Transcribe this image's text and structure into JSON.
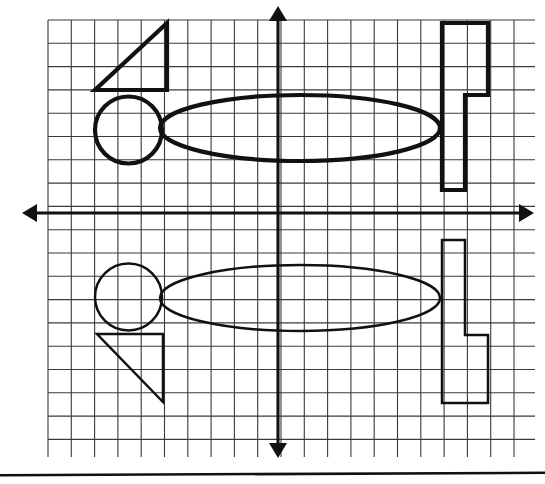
{
  "page": {
    "background_color": "#fdfdfb",
    "ink_color": "#111111",
    "grid_color": "#3a3a3a",
    "width": 545,
    "height": 484
  },
  "grid": {
    "label": "Graph paper grid",
    "cell_size": 23.3,
    "origin_x": 278,
    "origin_y": 213,
    "x_first": 48,
    "x_last": 535,
    "y_first": 20,
    "y_last": 457,
    "columns": 21,
    "rows": 19
  },
  "axes": {
    "x_axis": {
      "name": "horizontal axis",
      "y": 213,
      "x_start": 22,
      "x_end": 534,
      "arrows": "both"
    },
    "y_axis": {
      "name": "vertical axis",
      "x": 278,
      "y_start": 6,
      "y_end": 458,
      "arrows": "both"
    }
  },
  "page_rule": {
    "name": "bottom page rule",
    "y": 474,
    "x_start": 0,
    "x_end": 545
  },
  "shapes": {
    "above_axis": [
      {
        "id": "triangle-top",
        "type": "polygon",
        "weight": "heavy",
        "points": "95,90 167,90 167,23",
        "description": "right triangle, right angle at lower-right, hypotenuse rising left to right"
      },
      {
        "id": "circle-top",
        "type": "circle",
        "weight": "heavy",
        "cx": 128.5,
        "cy": 130,
        "r": 33.5,
        "description": "circle tangent to triangle base"
      },
      {
        "id": "ellipse-top",
        "type": "ellipse",
        "weight": "heavy",
        "cx": 300,
        "cy": 128,
        "rx": 140,
        "ry": 33,
        "description": "wide horizontal ellipse crossing the vertical axis"
      },
      {
        "id": "flag-top",
        "type": "polygon",
        "weight": "heavy",
        "points": "442,23 488,23 488,95 465,95 465,190 442,190",
        "description": "F-shaped block polygon at right, wide part at top"
      }
    ],
    "below_axis": [
      {
        "id": "triangle-bottom",
        "type": "polygon",
        "weight": "light",
        "points": "97,334 163,334 163,402",
        "description": "right triangle, right angle at upper-right, hypotenuse falling left to right"
      },
      {
        "id": "circle-bottom",
        "type": "circle",
        "weight": "light",
        "cx": 128.5,
        "cy": 297,
        "r": 33.5,
        "description": "circle tangent to triangle top edge"
      },
      {
        "id": "ellipse-bottom",
        "type": "ellipse",
        "weight": "light",
        "cx": 300,
        "cy": 298,
        "rx": 140,
        "ry": 33,
        "description": "wide horizontal ellipse crossing the vertical axis"
      },
      {
        "id": "flag-bottom",
        "type": "polygon",
        "weight": "light",
        "points": "442,240 465,240 465,335 488,335 488,403 442,403",
        "description": "F-shaped block polygon at right, wide part at bottom"
      }
    ]
  }
}
